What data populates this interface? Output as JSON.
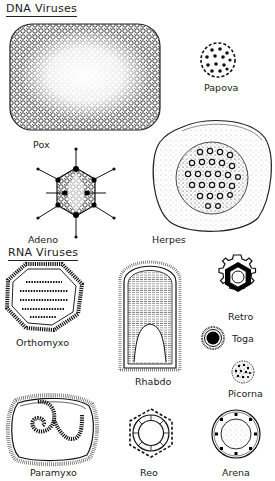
{
  "diagram": {
    "sections": [
      {
        "heading": "DNA Viruses",
        "viruses": [
          {
            "name": "Pox",
            "shape": "rounded-rectangle-brick"
          },
          {
            "name": "Papova",
            "shape": "small-icosahedron-dotted"
          },
          {
            "name": "Adeno",
            "shape": "icosahedron-with-fibers"
          },
          {
            "name": "Herpes",
            "shape": "enveloped-icosahedral-capsid"
          }
        ]
      },
      {
        "heading": "RNA Viruses",
        "viruses": [
          {
            "name": "Orthomyxo",
            "shape": "enveloped-segmented-helical"
          },
          {
            "name": "Rhabdo",
            "shape": "bullet-shaped"
          },
          {
            "name": "Retro",
            "shape": "enveloped-hexagonal-core"
          },
          {
            "name": "Toga",
            "shape": "small-enveloped-sphere"
          },
          {
            "name": "Picorna",
            "shape": "tiny-icosahedron"
          },
          {
            "name": "Paramyxo",
            "shape": "pleomorphic-enveloped-helical"
          },
          {
            "name": "Reo",
            "shape": "double-capsid-hexagon"
          },
          {
            "name": "Arena",
            "shape": "enveloped-granular-sphere"
          }
        ]
      }
    ]
  }
}
